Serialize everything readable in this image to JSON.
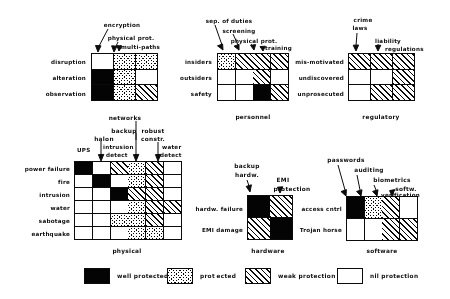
{
  "figure": {
    "fill_types": {
      "well": "well protected",
      "prot": "protected",
      "weak": "weak protection",
      "nil": "nil protection"
    }
  },
  "legend": {
    "items": [
      {
        "key": "well",
        "label": "well protected"
      },
      {
        "key": "prot",
        "label": "prot ected"
      },
      {
        "key": "weak",
        "label": "weak protection"
      },
      {
        "key": "nil",
        "label": "nil protection"
      }
    ]
  },
  "matrices": [
    {
      "id": "communications",
      "caption": "",
      "columns": [
        "encryption",
        "physical prot.",
        "multi-paths"
      ],
      "rows": [
        "disruption",
        "alteration",
        "observation"
      ],
      "cells": [
        [
          "nil",
          "prot",
          "prot"
        ],
        [
          "well",
          "prot",
          "nil"
        ],
        [
          "well",
          "prot",
          "weak"
        ]
      ]
    },
    {
      "id": "personnel",
      "caption": "personnel",
      "columns": [
        "sep. of duties",
        "screening",
        "physical prot.",
        "training"
      ],
      "rows": [
        "insiders",
        "outsiders",
        "safety"
      ],
      "cells": [
        [
          "prot",
          "weak",
          "weak",
          "weak"
        ],
        [
          "nil",
          "nil",
          "weak",
          "nil"
        ],
        [
          "nil",
          "nil",
          "well",
          "weak"
        ]
      ]
    },
    {
      "id": "regulatory",
      "caption": "regulatory",
      "columns": [
        "crime laws",
        "liability",
        "regulations"
      ],
      "rows": [
        "mis-motivated",
        "undiscovered",
        "unprosecuted"
      ],
      "cells": [
        [
          "weak",
          "weak",
          "weak"
        ],
        [
          "nil",
          "nil",
          "weak"
        ],
        [
          "nil",
          "weak",
          "weak"
        ]
      ]
    },
    {
      "id": "physical",
      "caption": "physical",
      "columns": [
        "UPS",
        "halon",
        "intrusion detect",
        "backup",
        "robust constr.",
        "water detect"
      ],
      "rows": [
        "power failure",
        "fire",
        "intrusion",
        "water",
        "sabotage",
        "earthquake"
      ],
      "cells": [
        [
          "well",
          "nil",
          "weak",
          "prot",
          "weak",
          "nil"
        ],
        [
          "nil",
          "well",
          "nil",
          "prot",
          "weak",
          "nil"
        ],
        [
          "nil",
          "nil",
          "well",
          "weak",
          "weak",
          "nil"
        ],
        [
          "nil",
          "nil",
          "nil",
          "prot",
          "weak",
          "weak"
        ],
        [
          "nil",
          "nil",
          "prot",
          "prot",
          "weak",
          "nil"
        ],
        [
          "nil",
          "nil",
          "nil",
          "prot",
          "prot",
          "nil"
        ]
      ]
    },
    {
      "id": "hardware",
      "caption": "hardware",
      "columns": [
        "backup hardw.",
        "EMI protection"
      ],
      "rows": [
        "hardw. failure",
        "EMI damage"
      ],
      "cells": [
        [
          "well",
          "weak"
        ],
        [
          "weak",
          "well"
        ]
      ]
    },
    {
      "id": "software",
      "caption": "software",
      "columns": [
        "passwords",
        "auditing",
        "biometrics",
        "softw. verification"
      ],
      "rows": [
        "access cntrl",
        "Trojan horse"
      ],
      "cells": [
        [
          "well",
          "prot",
          "weak",
          "nil"
        ],
        [
          "nil",
          "nil",
          "weak",
          "weak"
        ]
      ]
    }
  ],
  "column_header_text": {
    "communications": {
      "encryption": "encryption",
      "physical_prot": "physical prot.",
      "multi_paths": "multi-paths"
    },
    "personnel": {
      "sep_of_duties": "sep. of duties",
      "screening": "screening",
      "physical_prot": "physical prot.",
      "training": "training"
    },
    "regulatory": {
      "crime": "crime",
      "laws": "laws",
      "liability": "liability",
      "regulations": "regulations"
    },
    "physical": {
      "networks": "networks",
      "halon": "halon",
      "backup": "backup",
      "robust": "robust",
      "constr": "constr.",
      "ups": "UPS",
      "intrusion": "intrusion",
      "detect": "detect",
      "water": "water",
      "water_detect": "detect"
    },
    "hardware": {
      "backup": "backup",
      "hardw": "hardw.",
      "emi": "EMI",
      "protection": "protection"
    },
    "software": {
      "passwords": "passwords",
      "auditing": "auditing",
      "biometrics": "biometrics",
      "softw": "softw.",
      "verification": "verification"
    }
  }
}
